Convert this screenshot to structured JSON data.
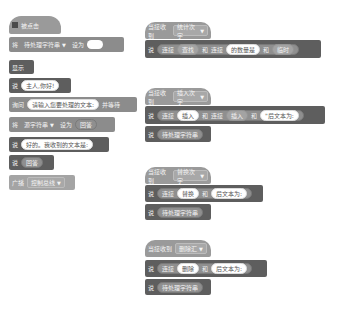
{
  "left_script": {
    "hat": {
      "flag_icon": "green-flag-icon",
      "label": "被点击"
    },
    "blocks": [
      {
        "label": "将",
        "var": "待处理字符串",
        "mid": "设为",
        "value": ""
      },
      {
        "label": "显示"
      },
      {
        "label": "说",
        "value": "主人,你好!"
      },
      {
        "label": "询问",
        "value": "请输入您要处理的文本:",
        "tail": "并等待"
      },
      {
        "label": "将",
        "var": "源字符串",
        "mid": "设为",
        "value": "回答"
      },
      {
        "label": "说",
        "value": "好的。我收到的文本是:"
      },
      {
        "label": "说",
        "value": "回答"
      },
      {
        "label": "广播",
        "value": "控制总线"
      }
    ]
  },
  "scripts": [
    {
      "hat_label": "当接收到",
      "hat_value": "统计次字",
      "say": "说",
      "parts": [
        "连接",
        "查找",
        "和",
        "连接",
        "的数量是",
        "和",
        "临时"
      ],
      "follow": null
    },
    {
      "hat_label": "当接收到",
      "hat_value": "插入次字",
      "say": "说",
      "parts": [
        "连接",
        "插入",
        "和",
        "连接",
        "插入",
        "和",
        "\"后文本为:"
      ],
      "follow": "待处理字符串"
    },
    {
      "hat_label": "当接收到",
      "hat_value": "替换次字",
      "say": "说",
      "parts": [
        "连接",
        "替换",
        "和",
        "后文本为:"
      ],
      "follow": "待处理字符串"
    },
    {
      "hat_label": "当接收到",
      "hat_value": "删除汇",
      "say": "说",
      "parts": [
        "连接",
        "删除",
        "和",
        "后文本为:"
      ],
      "follow": "待处理字符串"
    }
  ],
  "colors": {
    "dark_block": "#5e5e5e",
    "hat_block": "#9a9a9a",
    "pill": "#8f8f8f",
    "background": "#ffffff"
  }
}
